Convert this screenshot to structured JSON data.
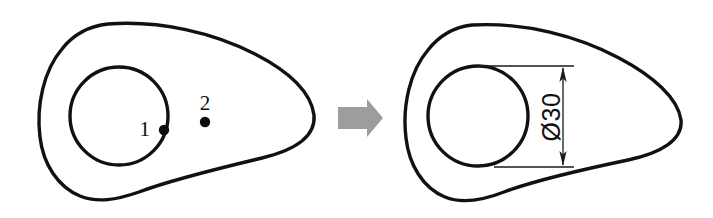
{
  "figure": {
    "background_color": "#ffffff",
    "stroke_color": "#111111",
    "arrow_color": "#9d9d9d"
  },
  "left_view": {
    "name": "undimensioned-cam-outline",
    "callouts": [
      {
        "id": "callout-1",
        "label": "1",
        "label_x": 150,
        "label_y": 136,
        "dot_x": 164,
        "dot_y": 130,
        "dot_r": 5.2
      },
      {
        "id": "callout-2",
        "label": "2",
        "label_x": 198,
        "label_y": 110,
        "dot_x": 205,
        "dot_y": 122,
        "dot_r": 5.2
      }
    ]
  },
  "transform_arrow": {
    "name": "transform-arrow",
    "direction": "right",
    "color": "#9d9d9d"
  },
  "right_view": {
    "name": "dimensioned-cam-outline",
    "dimension": {
      "id": "diameter-dimension",
      "symbol": "Ø",
      "value": "30",
      "text": "Ø30",
      "orientation": "vertical",
      "text_rotation_deg": -90,
      "text_x": 553,
      "text_y": 117,
      "line_x": 563,
      "line_top_y": 66,
      "line_bottom_y": 167,
      "ext_top_left_x": 478,
      "ext_bottom_left_x": 494,
      "ext_right_x": 574
    }
  }
}
